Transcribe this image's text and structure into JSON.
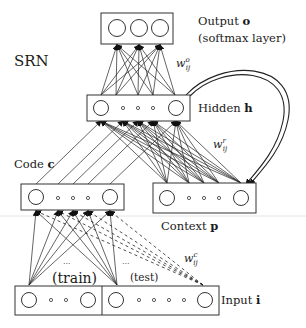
{
  "title": "SRN",
  "layers": {
    "output": {
      "label": "Output",
      "symbol": "o",
      "note": "(softmax layer)",
      "units": 3
    },
    "hidden": {
      "label": "Hidden",
      "symbol": "h",
      "units": 5
    },
    "code": {
      "label": "Code",
      "symbol": "c",
      "units": 5
    },
    "context": {
      "label": "Context",
      "symbol": "p",
      "units": 5
    },
    "input": {
      "label": "Input",
      "symbol": "i",
      "train_label": "(train)",
      "test_label": "(test)",
      "ellipsis": "..."
    }
  },
  "weights": {
    "output": {
      "base": "w",
      "sup": "o",
      "sub": "ij"
    },
    "recurrent": {
      "base": "w",
      "sup": "r",
      "sub": "ij"
    },
    "code": {
      "base": "w",
      "sup": "c",
      "sub": "ij"
    }
  },
  "colors": {
    "ink": "#222222",
    "background": "#ffffff"
  }
}
